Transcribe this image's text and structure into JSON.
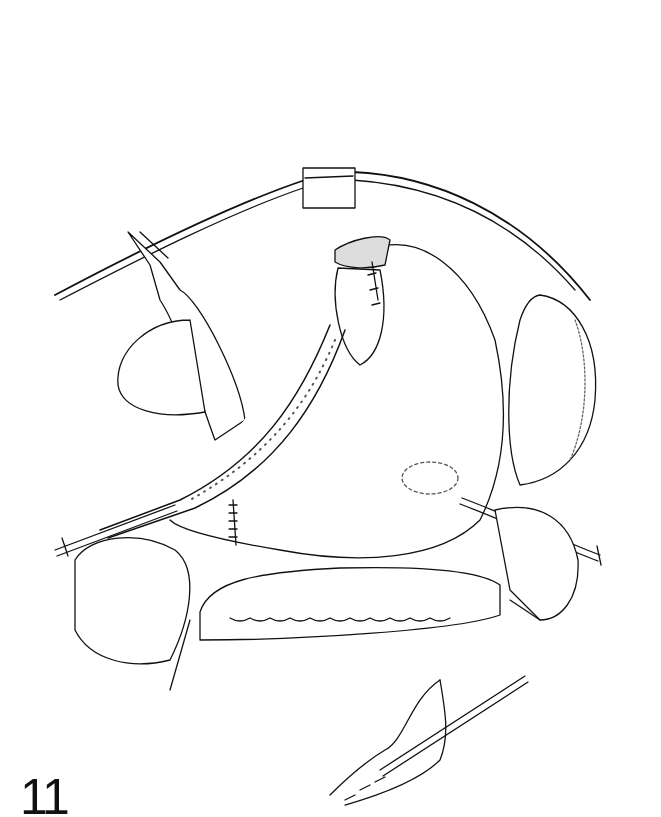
{
  "figure": {
    "number": "11",
    "type": "surgical line illustration",
    "colors": {
      "ink": "#111111",
      "background": "#ffffff"
    }
  }
}
